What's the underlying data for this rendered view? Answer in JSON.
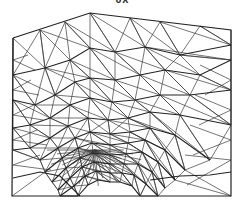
{
  "title": "UX",
  "colors": {
    "line": "#2a2a2a",
    "background": "#ffffff"
  },
  "mesh": {
    "boundary": [
      [
        13,
        38
      ],
      [
        90,
        13
      ],
      [
        231,
        30
      ],
      [
        231,
        196
      ],
      [
        12,
        196
      ],
      [
        13,
        38
      ]
    ],
    "focus": [
      95,
      150
    ],
    "layers": [
      [
        [
          13,
          75
        ],
        [
          45,
          68
        ],
        [
          70,
          60
        ],
        [
          90,
          48
        ],
        [
          115,
          52
        ],
        [
          145,
          47
        ],
        [
          180,
          55
        ],
        [
          231,
          45
        ]
      ],
      [
        [
          13,
          100
        ],
        [
          35,
          105
        ],
        [
          55,
          95
        ],
        [
          75,
          82
        ],
        [
          90,
          78
        ],
        [
          115,
          80
        ],
        [
          140,
          75
        ],
        [
          165,
          70
        ],
        [
          200,
          75
        ],
        [
          231,
          60
        ]
      ],
      [
        [
          13,
          128
        ],
        [
          30,
          125
        ],
        [
          50,
          118
        ],
        [
          70,
          105
        ],
        [
          90,
          98
        ],
        [
          112,
          102
        ],
        [
          135,
          100
        ],
        [
          160,
          95
        ],
        [
          190,
          95
        ],
        [
          231,
          90
        ]
      ],
      [
        [
          13,
          150
        ],
        [
          30,
          148
        ],
        [
          50,
          138
        ],
        [
          68,
          126
        ],
        [
          88,
          118
        ],
        [
          108,
          120
        ],
        [
          128,
          118
        ],
        [
          150,
          112
        ],
        [
          180,
          115
        ],
        [
          231,
          125
        ]
      ],
      [
        [
          40,
          160
        ],
        [
          58,
          148
        ],
        [
          75,
          138
        ],
        [
          90,
          132
        ],
        [
          110,
          134
        ],
        [
          130,
          132
        ],
        [
          150,
          128
        ],
        [
          175,
          135
        ],
        [
          210,
          160
        ]
      ],
      [
        [
          45,
          172
        ],
        [
          62,
          158
        ],
        [
          78,
          148
        ],
        [
          92,
          143
        ],
        [
          110,
          145
        ],
        [
          128,
          143
        ],
        [
          145,
          140
        ],
        [
          165,
          150
        ],
        [
          185,
          170
        ]
      ],
      [
        [
          52,
          182
        ],
        [
          66,
          168
        ],
        [
          80,
          158
        ],
        [
          93,
          153
        ],
        [
          110,
          155
        ],
        [
          126,
          154
        ],
        [
          142,
          152
        ],
        [
          158,
          162
        ],
        [
          175,
          180
        ]
      ],
      [
        [
          58,
          190
        ],
        [
          70,
          178
        ],
        [
          82,
          167
        ],
        [
          94,
          162
        ],
        [
          110,
          164
        ],
        [
          124,
          164
        ],
        [
          138,
          164
        ],
        [
          152,
          172
        ],
        [
          165,
          188
        ]
      ],
      [
        [
          60,
          196
        ],
        [
          74,
          186
        ],
        [
          85,
          176
        ],
        [
          96,
          171
        ],
        [
          110,
          173
        ],
        [
          122,
          173
        ],
        [
          134,
          175
        ],
        [
          146,
          184
        ],
        [
          158,
          196
        ]
      ],
      [
        [
          78,
          196
        ],
        [
          88,
          185
        ],
        [
          98,
          180
        ],
        [
          110,
          182
        ],
        [
          120,
          182
        ],
        [
          132,
          186
        ],
        [
          140,
          196
        ]
      ],
      [
        [
          13,
          178
        ],
        [
          40,
          172
        ],
        [
          60,
          176
        ],
        [
          80,
          196
        ]
      ],
      [
        [
          150,
          180
        ],
        [
          180,
          176
        ],
        [
          210,
          175
        ],
        [
          231,
          172
        ]
      ]
    ]
  }
}
